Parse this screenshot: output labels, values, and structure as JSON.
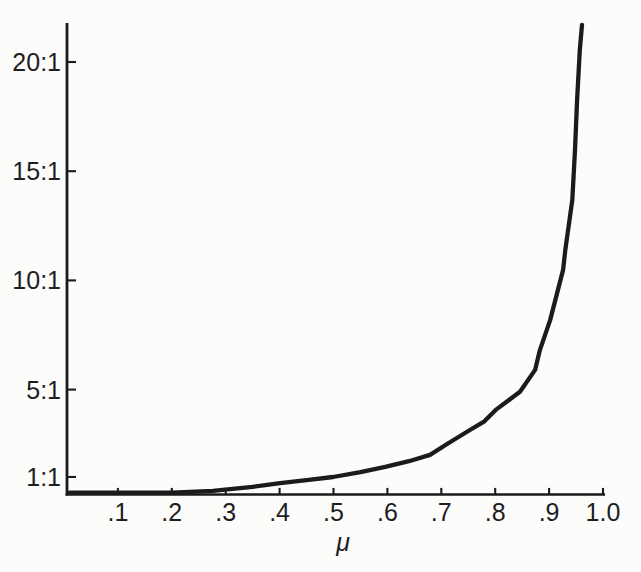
{
  "figure": {
    "background": "#fcfcfb",
    "ink": "#1b1b1b"
  },
  "chart_data": {
    "type": "line",
    "title": "",
    "xlabel": "μ",
    "ylabel": "",
    "xlim": [
      0,
      1.0
    ],
    "ylim": [
      0,
      21.8
    ],
    "grid": false,
    "legend": "none",
    "x_ticks": {
      "values": [
        0.1,
        0.2,
        0.3,
        0.4,
        0.5,
        0.6,
        0.7,
        0.8,
        0.9,
        1.0
      ],
      "labels": [
        ".1",
        ".2",
        ".3",
        ".4",
        ".5",
        ".6",
        ".7",
        ".8",
        ".9",
        "1.0"
      ]
    },
    "y_ticks": {
      "values": [
        1,
        5,
        10,
        15,
        20
      ],
      "labels": [
        "1:1",
        "5:1",
        "10:1",
        "15:1",
        "20:1"
      ]
    },
    "series": [
      {
        "name": "ratio-curve",
        "points": [
          [
            0.01,
            0.01
          ],
          [
            0.1,
            0.1
          ],
          [
            0.2,
            0.25
          ],
          [
            0.276,
            0.36
          ],
          [
            0.35,
            0.55
          ],
          [
            0.401,
            0.72
          ],
          [
            0.45,
            0.85
          ],
          [
            0.499,
            1.0
          ],
          [
            0.55,
            1.22
          ],
          [
            0.596,
            1.46
          ],
          [
            0.64,
            1.72
          ],
          [
            0.679,
            2.01
          ],
          [
            0.71,
            2.5
          ],
          [
            0.753,
            3.15
          ],
          [
            0.78,
            3.55
          ],
          [
            0.801,
            4.07
          ],
          [
            0.846,
            4.9
          ],
          [
            0.874,
            5.9
          ],
          [
            0.883,
            6.81
          ],
          [
            0.902,
            8.19
          ],
          [
            0.926,
            10.48
          ],
          [
            0.93,
            11.39
          ],
          [
            0.943,
            13.68
          ],
          [
            0.948,
            15.97
          ],
          [
            0.952,
            18.26
          ],
          [
            0.957,
            20.55
          ],
          [
            0.961,
            21.7
          ]
        ]
      }
    ]
  }
}
